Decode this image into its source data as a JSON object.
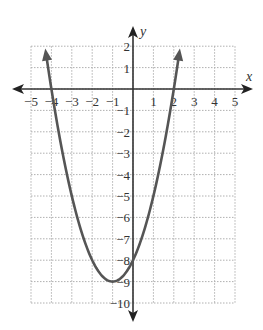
{
  "chart_data": {
    "type": "line",
    "title": "",
    "equation": "y = x^2 + 2x - 8",
    "xlabel": "x",
    "ylabel": "y",
    "xlim": [
      -5,
      5
    ],
    "ylim": [
      -10,
      2
    ],
    "grid": true,
    "x_ticks": [
      -5,
      -4,
      -3,
      -2,
      -1,
      1,
      2,
      3,
      4,
      5
    ],
    "x_tick_labels": [
      "−5",
      "−4",
      "−3",
      "−2",
      "−1",
      "1",
      "2",
      "3",
      "4",
      "5"
    ],
    "y_ticks": [
      2,
      1,
      -1,
      -2,
      -3,
      -4,
      -5,
      -6,
      -7,
      -8,
      -9,
      -10
    ],
    "y_tick_labels": [
      "2",
      "1",
      "−1",
      "−2",
      "−3",
      "−4",
      "−5",
      "−6",
      "−7",
      "−8",
      "−9",
      "−10"
    ],
    "series": [
      {
        "name": "parabola",
        "x": [
          -4.3,
          -4,
          -3,
          -2,
          -1,
          0,
          1,
          2,
          2.3
        ],
        "values": [
          2.19,
          0,
          -5,
          -8,
          -9,
          -8,
          -5,
          0,
          2.19
        ]
      }
    ],
    "key_points": {
      "vertex": [
        -1,
        -9
      ],
      "x_intercepts": [
        [
          -4,
          0
        ],
        [
          2,
          0
        ]
      ],
      "y_intercept": [
        0,
        -8
      ]
    },
    "colors": {
      "curve": "#555555",
      "axis": "#333333",
      "grid": "#b0b0b0"
    }
  }
}
